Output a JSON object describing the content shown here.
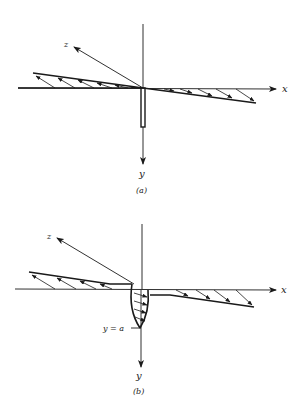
{
  "figure": {
    "panels": [
      {
        "id": "a",
        "caption": "(a)",
        "axes": {
          "x_label": "x",
          "y_label": "y",
          "z_label": "z"
        },
        "description": "Linear shear-stress distribution along x through origin with thin rod along y"
      },
      {
        "id": "b",
        "caption": "(b)",
        "axes": {
          "x_label": "x",
          "y_label": "y",
          "z_label": "z"
        },
        "depth_label": "y = a",
        "description": "Linear distribution along x plus curved stress distribution along y down to depth y = a"
      }
    ],
    "colors": {
      "ink": "#1a1a1a",
      "background": "#ffffff"
    }
  }
}
